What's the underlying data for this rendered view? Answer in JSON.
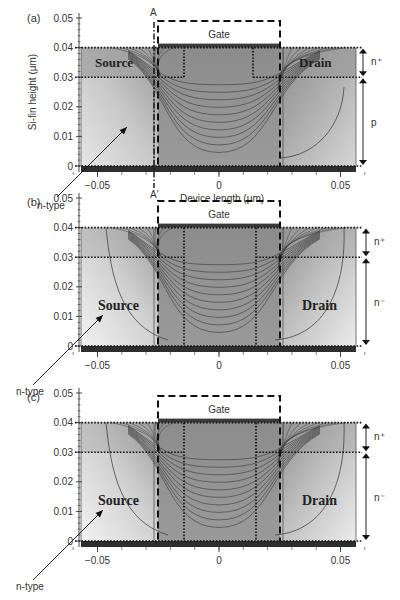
{
  "figure": {
    "axis_x_label": "Device length (μm)",
    "axis_y_label": "Si-fin height (μm)",
    "x_ticks": [
      {
        "label": "−0.05",
        "value": -0.05
      },
      {
        "label": "0",
        "value": 0
      },
      {
        "label": "0.05",
        "value": 0.05
      }
    ],
    "y_ticks": [
      {
        "label": "0",
        "value": 0
      },
      {
        "label": "0.01",
        "value": 0.01
      },
      {
        "label": "0.02",
        "value": 0.02
      },
      {
        "label": "0.03",
        "value": 0.03
      },
      {
        "label": "0.04",
        "value": 0.04
      },
      {
        "label": "0.05",
        "value": 0.05
      }
    ],
    "gate_label": "Gate",
    "source_label": "Source",
    "drain_label": "Drain",
    "ntype_label": "n-type",
    "nplus_label": "n⁺",
    "colors": {
      "gate_bar": "#3a3a3a",
      "bottom_bar": "#2e2e2e",
      "channel_fill": "#8a8a8a",
      "dark_region": "#7a7a7a",
      "light_region": "#d8d8d8",
      "line": "#222222"
    }
  },
  "panels": [
    {
      "id": "a",
      "label": "(a)",
      "section_top": "A",
      "section_bottom": "A′",
      "lower_label": "p",
      "source_label_pos": "top",
      "drain_label_pos": "top",
      "show_x_axis_title": true,
      "top": 0
    },
    {
      "id": "b",
      "label": "(b)",
      "lower_label": "n⁻",
      "source_label_pos": "bottom",
      "drain_label_pos": "bottom",
      "show_x_axis_title": false,
      "top": 195
    },
    {
      "id": "c",
      "label": "(c)",
      "lower_label": "n⁻",
      "source_label_pos": "bottom",
      "drain_label_pos": "bottom",
      "show_x_axis_title": false,
      "top": 390
    }
  ]
}
